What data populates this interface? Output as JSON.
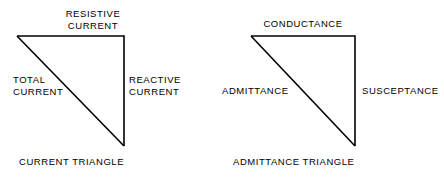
{
  "figures": [
    {
      "id": "current-triangle",
      "caption": "CURRENT TRIANGLE",
      "labels": {
        "top": "RESISTIVE\nCURRENT",
        "hypotenuse": "TOTAL\nCURRENT",
        "vertical": "REACTIVE\nCURRENT"
      },
      "geometry": {
        "top_left": [
          17,
          36
        ],
        "top_right": [
          124,
          36
        ],
        "bottom_right": [
          124,
          146
        ]
      }
    },
    {
      "id": "admittance-triangle",
      "caption": "ADMITTANCE TRIANGLE",
      "labels": {
        "top": "CONDUCTANCE",
        "hypotenuse": "ADMITTANCE",
        "vertical": "SUSCEPTANCE"
      },
      "geometry": {
        "top_left": [
          251,
          36
        ],
        "top_right": [
          355,
          36
        ],
        "bottom_right": [
          355,
          146
        ]
      }
    }
  ],
  "style": {
    "line_color": "#000000",
    "background": "#ffffff",
    "text_color": "#000000"
  }
}
